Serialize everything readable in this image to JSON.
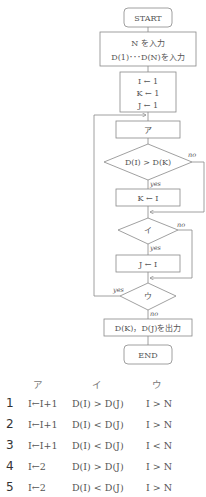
{
  "intro_text": "組合せとして正しいものを選べ（一部表示）",
  "flowchart": {
    "start": "START",
    "input_line1": "N を入力",
    "input_line2": "D(1)･･･D(N)を入力",
    "init_line1": "I ← 1",
    "init_line2": "K ← 1",
    "init_line3": "J ← 1",
    "box_a": "ア",
    "cond1": "D(I) > D(K)",
    "cond1_no": "no",
    "cond1_yes": "yes",
    "assign_k": "K ← I",
    "cond_i": "イ",
    "cond_i_no": "no",
    "cond_i_yes": "yes",
    "assign_j": "J ← I",
    "cond_u": "ウ",
    "cond_u_yes": "yes",
    "cond_u_no": "no",
    "output": "D(K)，D(J)を出力",
    "end": "END"
  },
  "choices": {
    "headers": [
      "ア",
      "イ",
      "ウ"
    ],
    "rows": [
      {
        "num": "1",
        "a": "I←I+1",
        "i": "D(I) > D(J)",
        "u": "I > N"
      },
      {
        "num": "2",
        "a": "I←I+1",
        "i": "D(I) < D(J)",
        "u": "I > N"
      },
      {
        "num": "3",
        "a": "I←I+1",
        "i": "D(I) < D(J)",
        "u": "I < N"
      },
      {
        "num": "4",
        "a": "I←2",
        "i": "D(I) > D(J)",
        "u": "I > N"
      },
      {
        "num": "5",
        "a": "I←2",
        "i": "D(I) < D(J)",
        "u": "I > N"
      }
    ]
  }
}
